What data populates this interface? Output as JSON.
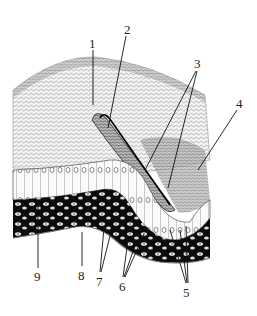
{
  "figure": {
    "type": "histology-illustration",
    "background": "#ffffff",
    "ink": "#111111"
  },
  "labels": [
    {
      "id": "1",
      "text": "1",
      "x": 93,
      "y": 48,
      "targets": [
        [
          93,
          105
        ]
      ]
    },
    {
      "id": "2",
      "text": "2",
      "x": 128,
      "y": 33,
      "targets": [
        [
          108,
          128
        ]
      ]
    },
    {
      "id": "3",
      "text": "3",
      "x": 198,
      "y": 68,
      "targets": [
        [
          145,
          170
        ],
        [
          168,
          188
        ]
      ]
    },
    {
      "id": "4",
      "text": "4",
      "x": 240,
      "y": 107,
      "targets": [
        [
          198,
          170
        ]
      ]
    },
    {
      "id": "5",
      "text": "5",
      "x": 187,
      "y": 296,
      "targets": [
        [
          170,
          230
        ],
        [
          180,
          230
        ],
        [
          186,
          226
        ]
      ]
    },
    {
      "id": "6",
      "text": "6",
      "x": 123,
      "y": 290,
      "targets": [
        [
          128,
          240
        ],
        [
          137,
          240
        ],
        [
          144,
          234
        ]
      ]
    },
    {
      "id": "7",
      "text": "7",
      "x": 100,
      "y": 285,
      "targets": [
        [
          104,
          228
        ],
        [
          114,
          220
        ]
      ]
    },
    {
      "id": "8",
      "text": "8",
      "x": 82,
      "y": 278,
      "targets": [
        [
          82,
          232
        ]
      ]
    },
    {
      "id": "9",
      "text": "9",
      "x": 38,
      "y": 280,
      "targets": [
        [
          38,
          200
        ]
      ]
    }
  ]
}
